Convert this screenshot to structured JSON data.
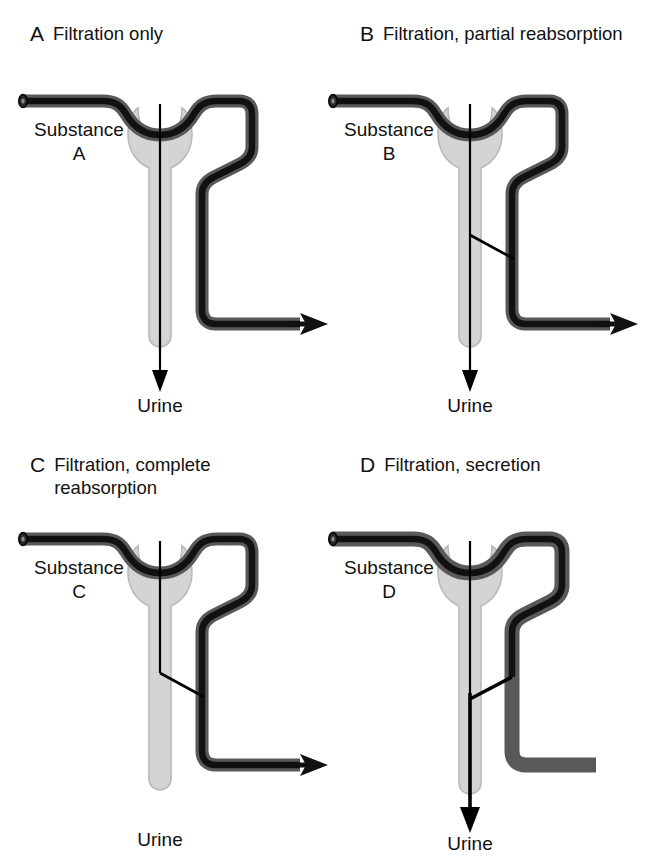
{
  "figure": {
    "caption": "Renal handling of four representative substances",
    "colors": {
      "tubule_fill": "#d4d4d4",
      "tubule_stroke": "#b8b8b8",
      "vessel_outer": "#595959",
      "vessel_inner": "#111111",
      "line": "#000000",
      "background": "#ffffff",
      "text": "#111111"
    }
  },
  "panels": [
    {
      "id": "A",
      "letter": "A",
      "title": "Filtration only",
      "substance_word": "Substance",
      "substance_letter": "A",
      "urine_label": "Urine",
      "has_urine_arrow": true,
      "has_vessel_outflow_arrow": true,
      "transport_line": "none",
      "process": "filtration"
    },
    {
      "id": "B",
      "letter": "B",
      "title": "Filtration, partial reabsorption",
      "substance_word": "Substance",
      "substance_letter": "B",
      "urine_label": "Urine",
      "has_urine_arrow": true,
      "has_vessel_outflow_arrow": true,
      "transport_line": "reabsorption-partial",
      "process": "filtration, partial reabsorption"
    },
    {
      "id": "C",
      "letter": "C",
      "title": "Filtration, complete reabsorption",
      "substance_word": "Substance",
      "substance_letter": "C",
      "urine_label": "Urine",
      "has_urine_arrow": false,
      "has_vessel_outflow_arrow": true,
      "transport_line": "reabsorption-complete",
      "process": "filtration, complete reabsorption"
    },
    {
      "id": "D",
      "letter": "D",
      "title": "Filtration, secretion",
      "substance_word": "Substance",
      "substance_letter": "D",
      "urine_label": "Urine",
      "has_urine_arrow": true,
      "has_vessel_outflow_arrow": false,
      "transport_line": "secretion",
      "process": "filtration, secretion"
    }
  ]
}
